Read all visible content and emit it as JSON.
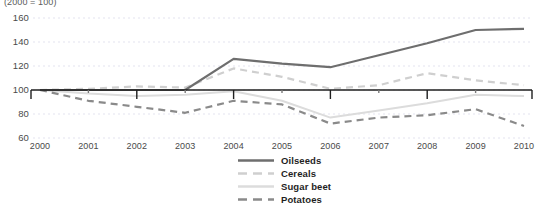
{
  "chart_data": {
    "type": "line",
    "title": "(2000 = 100)",
    "xlabel": "",
    "ylabel": "",
    "x": [
      2000,
      2001,
      2002,
      2003,
      2004,
      2005,
      2006,
      2007,
      2008,
      2009,
      2010
    ],
    "categories": [
      "2000",
      "2001",
      "2002",
      "2003",
      "2004",
      "2005",
      "2006",
      "2007",
      "2008",
      "2009",
      "2010"
    ],
    "xlim": [
      2000,
      2010
    ],
    "ylim": [
      55,
      165
    ],
    "yticks": [
      60,
      80,
      100,
      120,
      140,
      160
    ],
    "ytick_labels": [
      "60",
      "80",
      "100",
      "120",
      "140",
      "160"
    ],
    "grid": true,
    "grid_axis": "y",
    "legend_position": "bottom-center",
    "series": [
      {
        "name": "Oilseeds",
        "color": "#6e6e6e",
        "style": "solid",
        "width": 2.2,
        "values": [
          100,
          100,
          100,
          100,
          126,
          122,
          119,
          129,
          139,
          150,
          151
        ]
      },
      {
        "name": "Cereals",
        "color": "#cfcfcf",
        "style": "dashed",
        "width": 2.2,
        "values": [
          100,
          101,
          103,
          102,
          118,
          111,
          101,
          104,
          114,
          108,
          104
        ]
      },
      {
        "name": "Sugar beet",
        "color": "#dcdcdc",
        "style": "solid",
        "width": 2.0,
        "values": [
          100,
          97,
          95,
          96,
          99,
          91,
          77,
          83,
          89,
          96,
          95
        ]
      },
      {
        "name": "Potatoes",
        "color": "#8a8a8a",
        "style": "dashed",
        "width": 2.2,
        "values": [
          100,
          91,
          86,
          81,
          91,
          88,
          72,
          77,
          79,
          84,
          70
        ]
      }
    ],
    "baseline": {
      "value": 100,
      "color": "#1f1f1f"
    }
  }
}
